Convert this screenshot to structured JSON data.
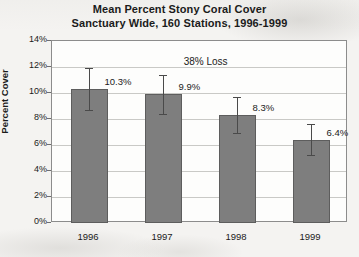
{
  "chart_data": {
    "type": "bar",
    "title": "Mean Percent Stony Coral Cover Sanctuary Wide, 160 Stations, 1996-1999",
    "title_lines": [
      "Mean Percent Stony Coral Cover",
      "Sanctuary Wide, 160 Stations, 1996-1999"
    ],
    "categories": [
      "1996",
      "1997",
      "1998",
      "1999"
    ],
    "values": [
      10.3,
      9.9,
      8.3,
      6.4
    ],
    "value_labels": [
      "10.3%",
      "9.9%",
      "8.3%",
      "6.4%"
    ],
    "error_upper": [
      1.6,
      1.5,
      1.4,
      1.2
    ],
    "error_lower": [
      1.6,
      1.5,
      1.4,
      1.2
    ],
    "xlabel": "",
    "ylabel": "Percent Cover",
    "ylim": [
      0,
      14
    ],
    "ytick_labels": [
      "0%",
      "2%",
      "4%",
      "6%",
      "8%",
      "10%",
      "12%",
      "14%"
    ],
    "ytick_values": [
      0,
      2,
      4,
      6,
      8,
      10,
      12,
      14
    ],
    "grid": true,
    "legend": false,
    "annotations": [
      {
        "text": "38% Loss",
        "x": 2.05,
        "y": 12.3
      }
    ],
    "series_color": "#7e7e7e",
    "grid_color": "#c9c9c6",
    "axis_color": "#8c8c8c"
  }
}
